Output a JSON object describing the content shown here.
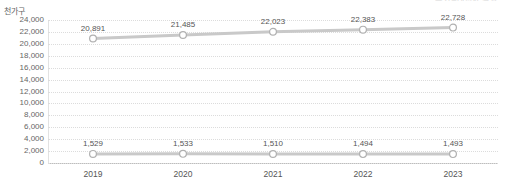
{
  "header": {
    "cropped_top_text": "주거실태조사 결과"
  },
  "chart_data": {
    "type": "line",
    "title": "",
    "subtitle": "",
    "xlabel": "",
    "ylabel": "천가구",
    "categories": [
      "2019",
      "2020",
      "2021",
      "2022",
      "2023"
    ],
    "ylim": [
      0,
      24000
    ],
    "ytick_step": 2000,
    "ytick_labels": [
      "24,000",
      "22,000",
      "20,000",
      "18,000",
      "16,000",
      "14,000",
      "12,000",
      "10,000",
      "8,000",
      "6,000",
      "4,000",
      "2,000",
      "0"
    ],
    "ytick_values": [
      24000,
      22000,
      20000,
      18000,
      16000,
      14000,
      12000,
      10000,
      8000,
      6000,
      4000,
      2000,
      0
    ],
    "grid": true,
    "grid_style": "dotted-horizontal",
    "legend": "none",
    "series": [
      {
        "name": "상위 계열",
        "values": [
          20891,
          21485,
          22023,
          22383,
          22728
        ],
        "labels": [
          "20,891",
          "21,485",
          "22,023",
          "22,383",
          "22,728"
        ],
        "line_color": "#c9c9c9",
        "marker_stroke": "#b0b0b0",
        "marker_fill": "#ffffff"
      },
      {
        "name": "하위 계열",
        "values": [
          1529,
          1533,
          1510,
          1494,
          1493
        ],
        "labels": [
          "1,529",
          "1,533",
          "1,510",
          "1,494",
          "1,493"
        ],
        "line_color": "#c9c9c9",
        "marker_stroke": "#b0b0b0",
        "marker_fill": "#ffffff"
      }
    ]
  }
}
